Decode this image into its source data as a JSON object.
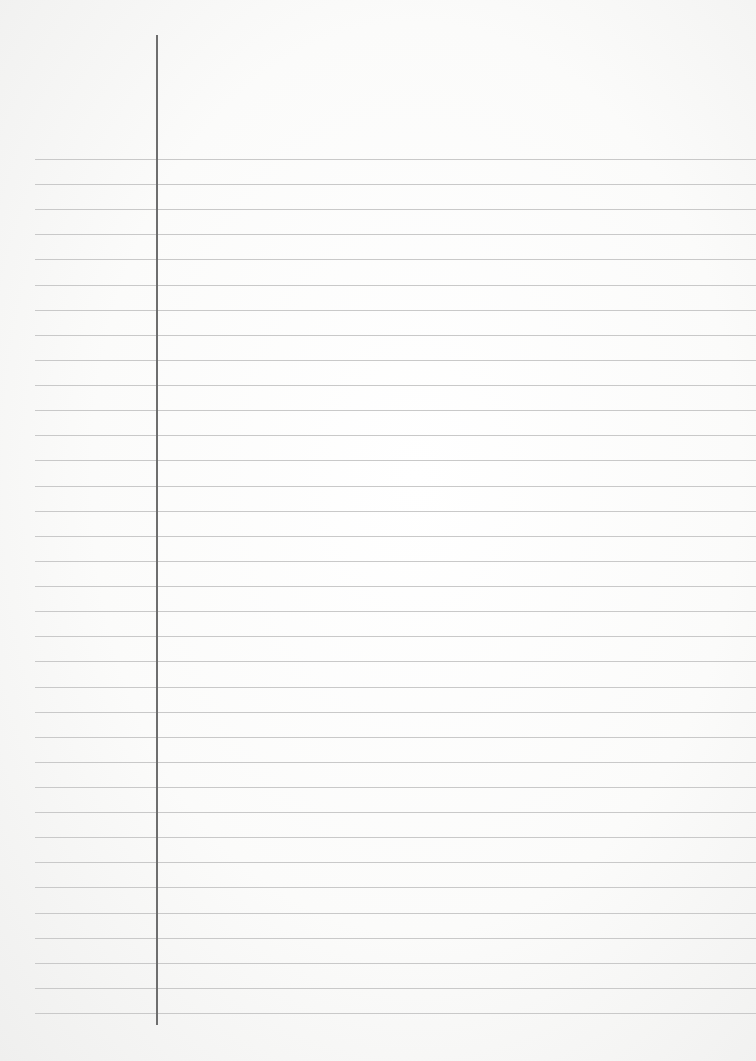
{
  "page": {
    "type": "lined-notebook-paper",
    "content_text": "",
    "background_color": "#fbfbfa",
    "rule_color": "#c9c9c9",
    "margin_line_color": "#6e6e6e",
    "rules": {
      "count": 35,
      "first_y": 159,
      "spacing": 25.12,
      "left_x": 35
    },
    "margin_line": {
      "x": 156,
      "top": 35,
      "bottom": 1025
    }
  }
}
